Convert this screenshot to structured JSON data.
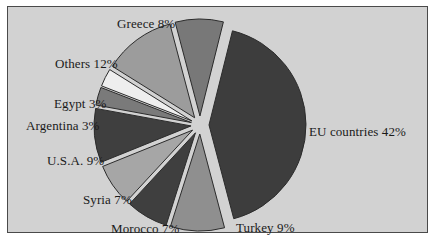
{
  "frame": {
    "background_color": "#d2d2d2",
    "border_color": "#4a4a4a",
    "page_background": "#ffffff"
  },
  "chart_data": {
    "type": "pie",
    "title": "",
    "subtitle": "",
    "xlabel": "",
    "ylabel": "",
    "legend_position": "none",
    "grid": false,
    "exploded": true,
    "labels_inline": true,
    "categories": [
      "EU countries",
      "Turkey",
      "Morocco",
      "Syria",
      "U.S.A.",
      "Argentina",
      "Egypt",
      "Others",
      "Greece"
    ],
    "values": [
      42,
      9,
      7,
      7,
      9,
      3,
      3,
      12,
      8
    ],
    "units": "%",
    "total": 100,
    "slices": [
      {
        "name": "EU countries",
        "value": 42,
        "label": "EU countries 42%",
        "color": "#3d3d3d",
        "label_x": 309,
        "label_y": 124
      },
      {
        "name": "Turkey",
        "value": 9,
        "label": "Turkey 9%",
        "color": "#8f8f8f",
        "label_x": 236,
        "label_y": 220
      },
      {
        "name": "Morocco",
        "value": 7,
        "label": "Morocco 7%",
        "color": "#3f3f3f",
        "label_x": 111,
        "label_y": 221
      },
      {
        "name": "Syria",
        "value": 7,
        "label": "Syria 7%",
        "color": "#a6a6a6",
        "label_x": 83,
        "label_y": 192
      },
      {
        "name": "U.S.A.",
        "value": 9,
        "label": "U.S.A. 9%",
        "color": "#3f3f3f",
        "label_x": 47,
        "label_y": 153
      },
      {
        "name": "Argentina",
        "value": 3,
        "label": "Argentina 3%",
        "color": "#7a7a7a",
        "label_x": 26,
        "label_y": 118
      },
      {
        "name": "Egypt",
        "value": 3,
        "label": "Egypt 3%",
        "color": "#eeeeee",
        "label_x": 54,
        "label_y": 96
      },
      {
        "name": "Others",
        "value": 12,
        "label": "Others 12%",
        "color": "#9c9c9c",
        "label_x": 55,
        "label_y": 56
      },
      {
        "name": "Greece",
        "value": 8,
        "label": "Greece 8%",
        "color": "#787878",
        "label_x": 117,
        "label_y": 16
      }
    ],
    "geometry": {
      "center_x": 200,
      "center_y": 125,
      "radius": 97,
      "explode_offset": 9,
      "start_angle_deg": -76,
      "direction": "clockwise",
      "stroke_color": "#2b2b2b"
    }
  }
}
